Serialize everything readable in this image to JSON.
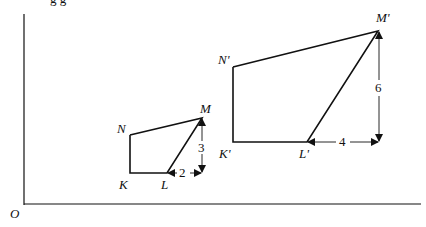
{
  "clipped_caption": "g                                  g",
  "origin_label": "O",
  "small_figure": {
    "labels": {
      "K": "K",
      "L": "L",
      "M": "M",
      "N": "N"
    },
    "horizontal_dim": "2",
    "vertical_dim": "3"
  },
  "large_figure": {
    "labels": {
      "K": "K'",
      "L": "L'",
      "M": "M'",
      "N": "N'"
    },
    "horizontal_dim": "4",
    "vertical_dim": "6"
  },
  "colors": {
    "stroke": "#111111",
    "background": "#ffffff"
  }
}
